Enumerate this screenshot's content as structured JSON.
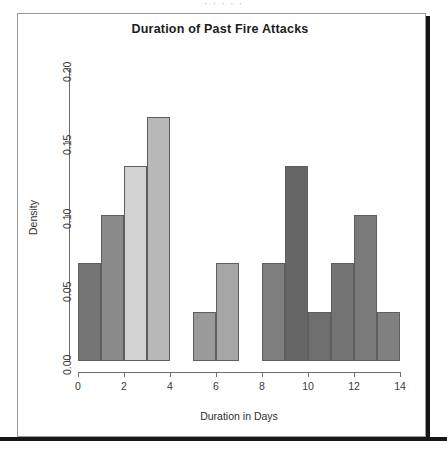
{
  "scan": {
    "top_cut_text": "·   ·  ·  ·   ·",
    "shadow_color": "#161616",
    "frame_border_color": "#9b9b9b"
  },
  "chart_data": {
    "type": "bar",
    "title": "Duration of Past Fire Attacks",
    "xlabel": "Duration in Days",
    "ylabel": "Density",
    "subtitle": "",
    "grid": false,
    "legend": null,
    "xlim": [
      0,
      14
    ],
    "ylim": [
      0.0,
      0.2
    ],
    "bin_width": 1,
    "x_ticks": [
      0,
      2,
      4,
      6,
      8,
      10,
      12,
      14
    ],
    "x_tick_labels": [
      "0",
      "2",
      "4",
      "6",
      "8",
      "10",
      "12",
      "14"
    ],
    "y_ticks": [
      0.0,
      0.05,
      0.1,
      0.15,
      0.2
    ],
    "y_tick_labels": [
      "0.00",
      "0.05",
      "0.10",
      "0.15",
      "0.20"
    ],
    "categories": [
      "0-1",
      "1-2",
      "2-3",
      "3-4",
      "4-5",
      "5-6",
      "6-7",
      "7-8",
      "8-9",
      "9-10",
      "10-11",
      "11-12",
      "12-13",
      "13-14"
    ],
    "bin_starts": [
      0,
      1,
      2,
      3,
      4,
      5,
      6,
      7,
      8,
      9,
      10,
      11,
      12,
      13
    ],
    "values": [
      0.0667,
      0.1,
      0.1333,
      0.1667,
      0,
      0.0333,
      0.0667,
      0,
      0.0667,
      0.1333,
      0.0333,
      0.0667,
      0.1,
      0.0333
    ],
    "value_labels": [
      "0.0667",
      "0.1000",
      "0.1333",
      "0.1667",
      "0.0000",
      "0.0333",
      "0.0667",
      "0.0000",
      "0.0667",
      "0.1333",
      "0.0333",
      "0.0667",
      "0.1000",
      "0.0333"
    ],
    "bar_colors": [
      "#757575",
      "#8a8a8a",
      "#d2d2d2",
      "#b8b8b8",
      "#ffffff",
      "#9a9a9a",
      "#a6a6a6",
      "#ffffff",
      "#7e7e7e",
      "#666666",
      "#6e6e6e",
      "#747474",
      "#7a7a7a",
      "#808080"
    ],
    "bar_edge_color": "#5e5e5e",
    "axis_color": "#6e6e6e",
    "text_color": "#2e2e2e",
    "background": "#ffffff"
  }
}
